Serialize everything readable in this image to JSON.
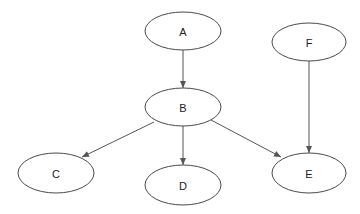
{
  "diagram": {
    "type": "directed-graph",
    "colors": {
      "node_stroke": "#4a4a4a",
      "edge": "#555555",
      "label": "#222222",
      "background": "#ffffff"
    },
    "nodes": [
      {
        "id": "A",
        "label": "A",
        "cx": 183,
        "cy": 31,
        "rx": 38,
        "ry": 19
      },
      {
        "id": "B",
        "label": "B",
        "cx": 183,
        "cy": 107,
        "rx": 38,
        "ry": 19
      },
      {
        "id": "C",
        "label": "C",
        "cx": 56,
        "cy": 173,
        "rx": 38,
        "ry": 20
      },
      {
        "id": "D",
        "label": "D",
        "cx": 183,
        "cy": 185,
        "rx": 38,
        "ry": 20
      },
      {
        "id": "E",
        "label": "E",
        "cx": 309,
        "cy": 173,
        "rx": 37,
        "ry": 20
      },
      {
        "id": "F",
        "label": "F",
        "cx": 309,
        "cy": 42,
        "rx": 37,
        "ry": 19
      }
    ],
    "edges": [
      {
        "from": "A",
        "to": "B",
        "x1": 183,
        "y1": 50,
        "x2": 183,
        "y2": 88
      },
      {
        "from": "B",
        "to": "C",
        "x1": 154,
        "y1": 122,
        "x2": 82,
        "y2": 157
      },
      {
        "from": "B",
        "to": "D",
        "x1": 183,
        "y1": 126,
        "x2": 183,
        "y2": 165
      },
      {
        "from": "B",
        "to": "E",
        "x1": 211,
        "y1": 120,
        "x2": 281,
        "y2": 157
      },
      {
        "from": "F",
        "to": "E",
        "x1": 309,
        "y1": 61,
        "x2": 309,
        "y2": 153
      }
    ]
  }
}
